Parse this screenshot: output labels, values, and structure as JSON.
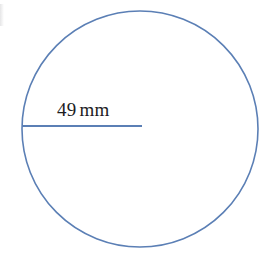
{
  "figure": {
    "background_color": "#ffffff",
    "stroke_color": "#5B7FB5",
    "text_color": "#1d1d1f",
    "circle": {
      "center_x": 140,
      "center_y": 129,
      "radius": 118,
      "stroke_width": 1.6
    },
    "radius_line": {
      "x1": 22,
      "y1": 126,
      "x2": 142,
      "y2": 126,
      "stroke_width": 2.1
    },
    "label": {
      "value": "49",
      "unit": "mm",
      "full_text": "49 mm"
    },
    "artifact": {
      "name": "scan-edge-artifact"
    }
  }
}
